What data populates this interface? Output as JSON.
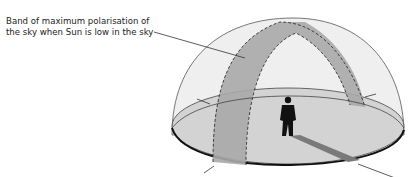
{
  "diagram": {
    "label_lines": [
      "Band of maximum polarisation of",
      "the sky when Sun is low in the sky"
    ],
    "elements": [
      "sky-dome",
      "ground-disc",
      "polarisation-band",
      "observer-silhouette",
      "observer-shadow",
      "tick-marks",
      "leader-line"
    ],
    "colors": {
      "dome": "#eeeeee",
      "ground": "#d2d2d2",
      "band": "#a9a9a9",
      "outline": "#1a1a1a",
      "figure": "#111111"
    }
  }
}
